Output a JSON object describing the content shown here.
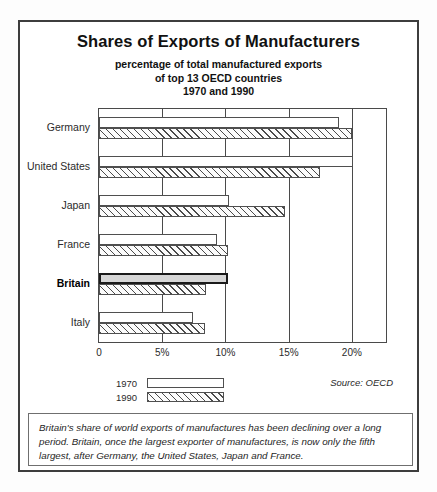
{
  "chart_data": {
    "type": "bar",
    "orientation": "horizontal",
    "title": "Shares of Exports of Manufacturers",
    "subtitle_lines": [
      "percentage of total manufactured exports",
      "of top 13 OECD countries",
      "1970 and 1990"
    ],
    "categories": [
      "Germany",
      "United States",
      "Japan",
      "France",
      "Britain",
      "Italy"
    ],
    "highlight_category": "Britain",
    "series": [
      {
        "name": "1970",
        "values": [
          19.0,
          20.1,
          10.3,
          9.3,
          10.2,
          7.4
        ]
      },
      {
        "name": "1990",
        "values": [
          20.0,
          17.5,
          14.7,
          10.2,
          8.5,
          8.4
        ]
      }
    ],
    "xlabel": "",
    "ylabel": "",
    "xlim": [
      0,
      22.7
    ],
    "xticks": [
      0,
      5,
      10,
      15,
      20
    ],
    "xtick_labels": [
      "0",
      "5%",
      "10%",
      "15%",
      "20%"
    ],
    "grid": true,
    "legend_position": "bottom-left",
    "legend": [
      {
        "label": "1970",
        "fill": "empty"
      },
      {
        "label": "1990",
        "fill": "diagonal-hatch"
      }
    ],
    "source": "Source: OECD",
    "annotation": "Britain's share of world exports of manufactures has been declining over a long period. Britain, once the largest exporter of manufactures, is now only the fifth largest, after Germany, the United States, Japan and France."
  },
  "colors": {
    "frame": "#3d3d3d",
    "axis": "#4a4a4a",
    "bar_outline": "#4f4f4f",
    "highlight_fill": "#d6d6d6",
    "highlight_outline": "#1a1a1a",
    "background": "#ffffff"
  }
}
